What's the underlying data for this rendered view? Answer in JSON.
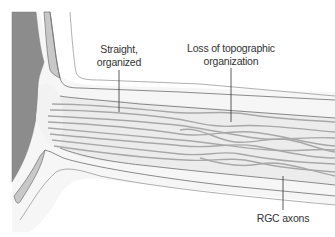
{
  "diagram": {
    "labels": {
      "straight": {
        "line1": "Straight,",
        "line2": "organized"
      },
      "loss": {
        "line1": "Loss of topographic",
        "line2": "organization"
      },
      "rgc": {
        "text": "RGC axons"
      }
    },
    "colors": {
      "eye_interior": "#8c8c8c",
      "sclera_band": "#c8c8c8",
      "nerve_fill": "#ececec",
      "outer_fill": "#f6f6f6",
      "outline": "#6e6e6e",
      "axon": "#a8a8a8",
      "leader": "#333333"
    }
  }
}
